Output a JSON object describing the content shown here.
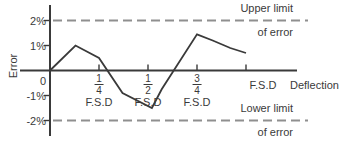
{
  "chart_data": {
    "type": "line",
    "title": "",
    "xlabel": "Deflection",
    "ylabel": "Error",
    "x_unit": "F.S.D",
    "xlim": [
      0,
      1.26
    ],
    "ylim": [
      -2.6,
      2.6
    ],
    "grid": false,
    "legend": false,
    "series": [
      {
        "name": "calibration-error-curve",
        "points": [
          [
            0,
            0
          ],
          [
            0.13,
            1.0
          ],
          [
            0.25,
            0.5
          ],
          [
            0.37,
            -0.9
          ],
          [
            0.52,
            -1.5
          ],
          [
            0.57,
            -0.75
          ],
          [
            0.75,
            1.45
          ],
          [
            0.83,
            1.2
          ],
          [
            0.92,
            0.9
          ],
          [
            1.0,
            0.7
          ]
        ]
      }
    ],
    "x_ticks": [
      {
        "value": 0.25,
        "num": "1",
        "den": "4",
        "sub": "F.S.D"
      },
      {
        "value": 0.5,
        "num": "1",
        "den": "2",
        "sub": "F.S.D"
      },
      {
        "value": 0.75,
        "num": "3",
        "den": "4",
        "sub": "F.S.D"
      },
      {
        "value": 1.0,
        "label": "F.S.D"
      }
    ],
    "y_ticks": [
      {
        "value": 2,
        "label": "2%"
      },
      {
        "value": 1,
        "label": "1%"
      },
      {
        "value": 0,
        "label": "0"
      },
      {
        "value": -1,
        "label": "-1%"
      },
      {
        "value": -2,
        "label": "-2%"
      }
    ],
    "limit_lines": [
      {
        "value": 2,
        "label_top": "Upper limit",
        "label_bottom": "of error",
        "style": "dashed"
      },
      {
        "value": -2,
        "label_top": "Lower limit",
        "label_bottom": "of error",
        "style": "dashed"
      }
    ],
    "colors": {
      "curve": "#3a3a3a",
      "axis": "#3a3a3a",
      "dashed": "#8f8f8f",
      "text": "#3a3a3a",
      "background": "#ffffff"
    }
  }
}
